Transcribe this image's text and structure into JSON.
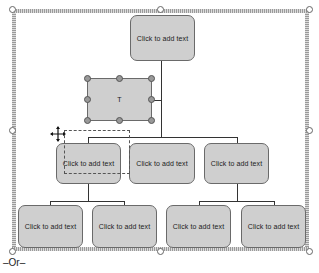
{
  "diagram": {
    "type": "organization-chart",
    "top_node": {
      "label": "Click to add text"
    },
    "assistant_node": {
      "label": "T",
      "selected": true
    },
    "level2": [
      {
        "label": "Click to add text"
      },
      {
        "label": "Click to add text"
      },
      {
        "label": "Click to add text"
      }
    ],
    "level3": [
      {
        "label": "Click to add text"
      },
      {
        "label": "Click to add text"
      },
      {
        "label": "Click to add text"
      },
      {
        "label": "Click to add text"
      }
    ]
  },
  "icons": {
    "move_cursor": "move-cursor-icon"
  },
  "caption": "–Or–"
}
